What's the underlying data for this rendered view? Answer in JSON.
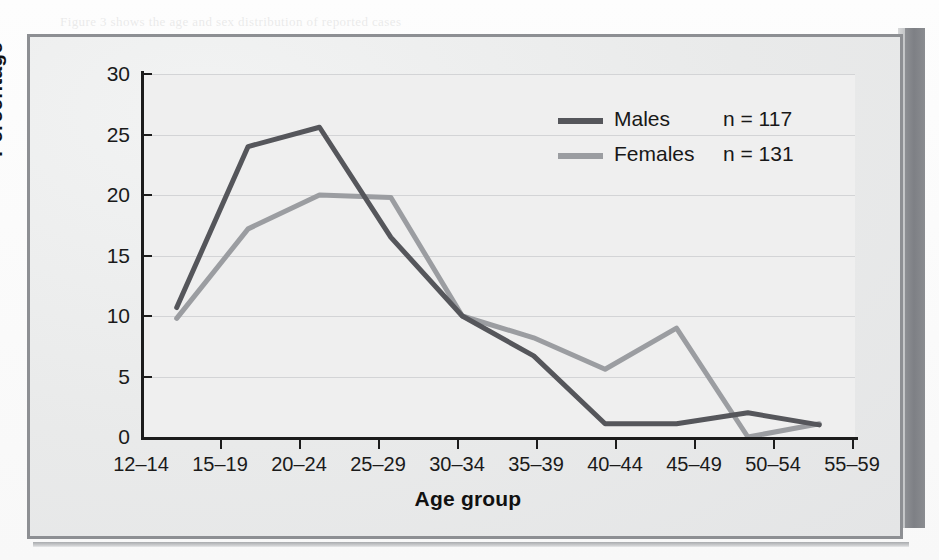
{
  "figure": {
    "axis_title_x": "Age group",
    "axis_title_y": "Percentage"
  },
  "legend": {
    "males": {
      "label": "Males",
      "n_text": "n = 117",
      "color": "#55565b"
    },
    "females": {
      "label": "Females",
      "n_text": "n = 131",
      "color": "#9b9da1"
    }
  },
  "ghost_text": [
    "of the notification of a confirmed case",
    "patients with a confirmed diagnosis",
    "reported during the period under",
    "review were in the age group",
    "the number of cases",
    "among young women",
    "compared with men of",
    "the same age group was",
    "notably higher in the",
    "reporting districts",
    "Figure 3 shows the age and sex distribution of reported cases"
  ],
  "chart_data": {
    "type": "line",
    "title": "",
    "xlabel": "Age group",
    "ylabel": "Percentage",
    "categories": [
      "12–14",
      "15–19",
      "20–24",
      "25–29",
      "30–34",
      "35–39",
      "40–44",
      "45–49",
      "50–54",
      "55–59"
    ],
    "yticks": [
      0,
      5,
      10,
      15,
      20,
      25,
      30
    ],
    "ylim": [
      0,
      30
    ],
    "grid": "horizontal",
    "legend_position": "upper-right",
    "series": [
      {
        "name": "Males",
        "n": 117,
        "color": "#55565b",
        "values": [
          10.7,
          24.0,
          25.6,
          16.5,
          10.0,
          6.7,
          1.1,
          1.1,
          2.0,
          1.0
        ]
      },
      {
        "name": "Females",
        "n": 131,
        "color": "#9b9da1",
        "values": [
          9.8,
          17.2,
          20.0,
          19.8,
          10.0,
          8.2,
          5.6,
          9.0,
          0.0,
          1.1
        ]
      }
    ]
  }
}
